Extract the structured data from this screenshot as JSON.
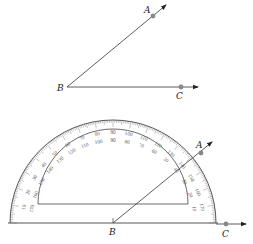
{
  "figure": {
    "type": "geometry-angle-measurement",
    "top_diagram": {
      "vertex": {
        "label": "B",
        "x": 67,
        "y": 87
      },
      "ray_a": {
        "point_label": "A",
        "point": [
          153,
          16
        ],
        "arrow_tip": [
          166,
          5
        ]
      },
      "ray_c": {
        "point_label": "C",
        "point": [
          181,
          87
        ],
        "arrow_tip": [
          198,
          87
        ]
      }
    },
    "protractor": {
      "center": [
        113,
        223
      ],
      "outer_radius": 103,
      "scale_label_radius_outer": 90,
      "scale_label_radius_inner": 82,
      "inner_arc_radius": 75,
      "inner_base_y": 204,
      "baseline_y": 223,
      "outer_scale": [
        10,
        20,
        30,
        40,
        50,
        60,
        70,
        80,
        90,
        100,
        110,
        120,
        130,
        140,
        150,
        160,
        170
      ],
      "inner_scale": [
        170,
        160,
        150,
        140,
        130,
        120,
        110,
        100,
        90,
        80,
        70,
        60,
        50,
        40,
        30,
        20,
        10
      ],
      "vertex": {
        "label": "B"
      },
      "ray_a": {
        "point_label": "A",
        "point": [
          201,
          153
        ],
        "arrow_tip": [
          212,
          142
        ]
      },
      "ray_c": {
        "point_label": "C",
        "point": [
          226,
          224
        ],
        "arrow_tip": [
          246,
          224
        ]
      }
    },
    "colors": {
      "line": "#333333",
      "point": "#888888",
      "scale_text": "#555555"
    }
  },
  "labels": {
    "top_A": "A",
    "top_B": "B",
    "top_C": "C",
    "bottom_A": "A",
    "bottom_B": "B",
    "bottom_C": "C"
  }
}
